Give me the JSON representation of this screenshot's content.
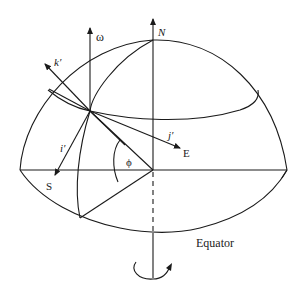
{
  "figure": {
    "type": "rotating-earth-coordinate-diagram",
    "labels": {
      "omega": "ω",
      "north": "N",
      "k_prime": "k′",
      "j_prime": "j′",
      "i_prime": "i′",
      "east": "E",
      "south": "S",
      "phi": "ϕ",
      "equator": "Equator"
    },
    "colors": {
      "stroke": "#1a1a1a",
      "background": "#ffffff"
    }
  }
}
